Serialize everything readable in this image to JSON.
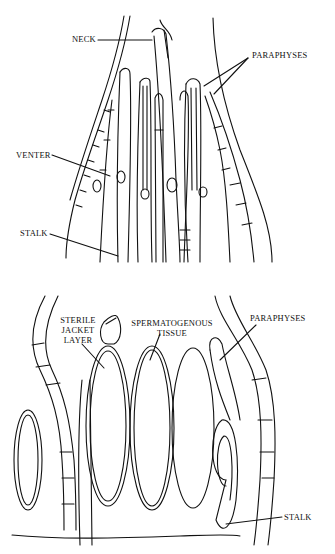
{
  "figures": [
    {
      "id": "top",
      "description": "Archegonia with paraphyses (longitudinal section)",
      "labels": {
        "neck": "NECK",
        "paraphyses": "PARAPHYSES",
        "venter": "VENTER",
        "stalk": "STALK"
      }
    },
    {
      "id": "bottom",
      "description": "Antheridia with paraphyses (longitudinal section)",
      "labels": {
        "sterile_line1": "STERILE",
        "sterile_line2": "JACKET",
        "sterile_line3": "LAYER",
        "sperm_line1": "SPERMATOGENOUS",
        "sperm_line2": "TISSUE",
        "paraphyses": "PARAPHYSES",
        "stalk": "STALK"
      }
    }
  ],
  "colors": {
    "line": "#111111",
    "background": "#ffffff"
  }
}
